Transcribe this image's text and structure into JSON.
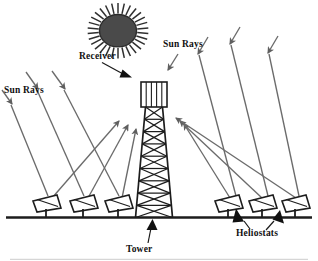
{
  "diagram": {
    "type": "schematic",
    "background_color": "#ffffff",
    "stroke_color": "#2b2b2b",
    "ray_color": "#6b6b6b",
    "sun_fill_color": "#4a4a4a",
    "label_color": "#111111",
    "labels": {
      "sun_rays_left": "Sun Rays",
      "sun_rays_right": "Sun Rays",
      "receiver": "Receiver",
      "tower": "Tower",
      "heliostats": "Heliostats"
    },
    "components": {
      "sun": {
        "name": "sun",
        "center_x": 118,
        "center_y": 32,
        "radius_x": 18,
        "radius_y": 15,
        "spike_count": 28,
        "fill": "#4a4a4a"
      },
      "tower": {
        "name": "tower",
        "top_box_x": 141,
        "top_box_y": 82,
        "top_box_width": 26,
        "top_box_height": 25,
        "top_box_divider_count": 4,
        "lattice_rows": 9,
        "base_y": 217,
        "base_half_width": 19
      },
      "ground": {
        "name": "ground-line",
        "y": 217,
        "x_start": 6,
        "x_end": 312
      },
      "heliostats_left": [
        {
          "x": 46,
          "y": 203
        },
        {
          "x": 83,
          "y": 203
        },
        {
          "x": 118,
          "y": 203
        }
      ],
      "heliostats_right": [
        {
          "x": 228,
          "y": 203
        },
        {
          "x": 262,
          "y": 203
        },
        {
          "x": 295,
          "y": 203
        }
      ],
      "incoming_rays_left_count": 4,
      "incoming_rays_right_count": 4,
      "reflected_rays_left_count": 3,
      "reflected_rays_right_count": 3
    }
  }
}
